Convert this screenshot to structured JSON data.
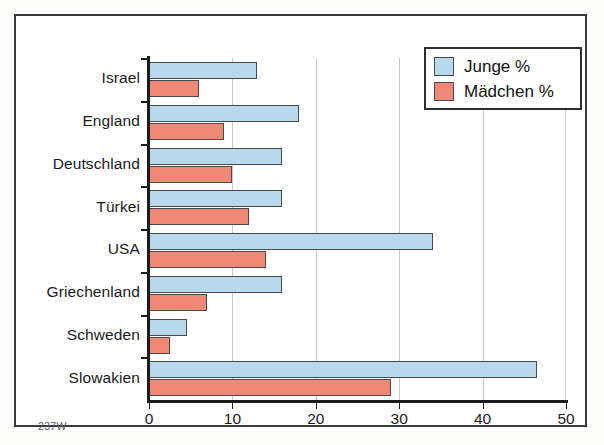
{
  "figure": {
    "source_code": "237W",
    "frame_color": "#3a3a3c",
    "background": "#ffffff"
  },
  "legend": {
    "position": "top-right",
    "entries": [
      {
        "label": "Junge %",
        "color": "#b8d9ec",
        "swatch_name": "legend-swatch-boys"
      },
      {
        "label": "Mädchen %",
        "color": "#f08878",
        "swatch_name": "legend-swatch-girls"
      }
    ]
  },
  "chart_data": {
    "type": "bar",
    "orientation": "horizontal",
    "title": "",
    "subtitle": "",
    "xlabel": "",
    "ylabel": "",
    "xlim": [
      0,
      50
    ],
    "xticks": [
      0,
      10,
      20,
      30,
      40,
      50
    ],
    "xtick_labels": [
      "0",
      "10",
      "20",
      "30",
      "40",
      "50"
    ],
    "grid": "vertical",
    "legend_position": "top-right",
    "categories": [
      "Israel",
      "England",
      "Deutschland",
      "Türkei",
      "USA",
      "Griechenland",
      "Schweden",
      "Slowakien"
    ],
    "series": [
      {
        "name": "Junge %",
        "color": "#b8d9ec",
        "values": [
          13,
          18,
          16,
          16,
          34,
          16,
          4.5,
          46.5
        ]
      },
      {
        "name": "Mädchen %",
        "color": "#f08878",
        "values": [
          6,
          9,
          10,
          12,
          14,
          7,
          2.5,
          29
        ]
      }
    ]
  }
}
